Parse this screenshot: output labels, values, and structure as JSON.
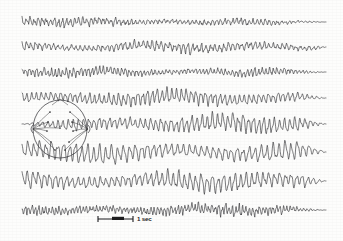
{
  "figure": {
    "kind": "eeg-recording",
    "background_color": "#fdfdfc",
    "ink_color": "#2b2b2e",
    "width": 343,
    "height": 241
  },
  "scale_bar": {
    "time_label": "1 sec",
    "x_start": 98,
    "x_end": 133,
    "y": 219,
    "block_x": 112,
    "block_width": 12,
    "label_x": 137,
    "label_y": 221
  },
  "head_diagram": {
    "name": "electrode-montage-head",
    "center_x": 60,
    "center_y": 129,
    "radius_x": 27,
    "radius_y": 29,
    "nasion_x": 60,
    "nasion_y": 100,
    "electrodes": [
      {
        "label": "Fp1",
        "x": 50,
        "y": 112
      },
      {
        "label": "Fp2",
        "x": 70,
        "y": 112
      },
      {
        "label": "F3",
        "x": 48,
        "y": 122
      },
      {
        "label": "F4",
        "x": 72,
        "y": 122
      },
      {
        "label": "Cz",
        "x": 60,
        "y": 128
      },
      {
        "label": "C3",
        "x": 47,
        "y": 131
      },
      {
        "label": "C4",
        "x": 73,
        "y": 131
      },
      {
        "label": "P3",
        "x": 51,
        "y": 142
      },
      {
        "label": "P4",
        "x": 69,
        "y": 142
      },
      {
        "label": "O1",
        "x": 55,
        "y": 150
      },
      {
        "label": "O2",
        "x": 65,
        "y": 150
      }
    ],
    "left_ear": {
      "x": 33,
      "y": 129
    },
    "right_ear": {
      "x": 88,
      "y": 129
    }
  },
  "chart_data": {
    "type": "line",
    "title": "",
    "xlabel": "",
    "ylabel": "",
    "x_start": 22,
    "x_end": 326,
    "grid": false,
    "legend": "none",
    "time_scale_seconds_per_px": 0.0286,
    "channels": [
      {
        "name": "channel-1",
        "baseline": 22,
        "amplitude": 3.0,
        "base_frequency": 1.55,
        "noise": 1.35,
        "slow_wave": 0.5,
        "slow_freq": 0.09,
        "seed": 11,
        "start_fade": 0.0,
        "end_fade": 0.72
      },
      {
        "name": "channel-2",
        "baseline": 47,
        "amplitude": 3.4,
        "base_frequency": 1.4,
        "noise": 1.5,
        "slow_wave": 1.1,
        "slow_freq": 0.055,
        "seed": 23,
        "start_fade": 0.0,
        "end_fade": 0.95
      },
      {
        "name": "channel-3",
        "baseline": 72,
        "amplitude": 3.2,
        "base_frequency": 1.7,
        "noise": 1.2,
        "slow_wave": 0.7,
        "slow_freq": 0.07,
        "seed": 37,
        "start_fade": 0.0,
        "end_fade": 0.8
      },
      {
        "name": "channel-4",
        "baseline": 98,
        "amplitude": 5.6,
        "base_frequency": 1.3,
        "noise": 1.1,
        "slow_wave": 1.3,
        "slow_freq": 0.05,
        "seed": 53,
        "start_fade": 0.0,
        "end_fade": 0.88
      },
      {
        "name": "channel-5",
        "baseline": 124,
        "amplitude": 6.6,
        "base_frequency": 1.22,
        "noise": 1.3,
        "slow_wave": 1.0,
        "slow_freq": 0.06,
        "seed": 71,
        "start_fade": 0.2,
        "end_fade": 0.92
      },
      {
        "name": "channel-6",
        "baseline": 152,
        "amplitude": 7.4,
        "base_frequency": 1.05,
        "noise": 1.0,
        "slow_wave": 1.6,
        "slow_freq": 0.045,
        "seed": 89,
        "start_fade": 0.0,
        "end_fade": 0.9
      },
      {
        "name": "channel-7",
        "baseline": 181,
        "amplitude": 7.0,
        "base_frequency": 1.12,
        "noise": 1.2,
        "slow_wave": 1.4,
        "slow_freq": 0.05,
        "seed": 101,
        "start_fade": 0.0,
        "end_fade": 0.93
      },
      {
        "name": "channel-8",
        "baseline": 210,
        "amplitude": 3.8,
        "base_frequency": 1.85,
        "noise": 1.6,
        "slow_wave": 0.8,
        "slow_freq": 0.065,
        "seed": 127,
        "start_fade": 0.0,
        "end_fade": 0.85
      }
    ]
  }
}
